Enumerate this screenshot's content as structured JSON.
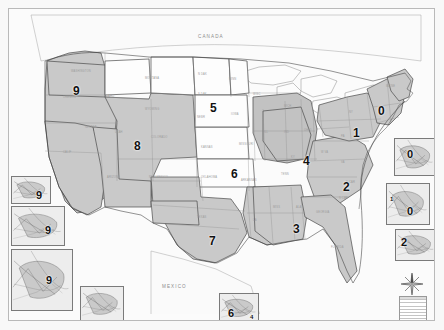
{
  "map": {
    "title": "United States Federal Judicial Circuits",
    "country_labels": [
      {
        "name": "canada",
        "text": "CANADA",
        "x": 197,
        "y": 33
      },
      {
        "name": "mexico",
        "text": "MEXICO",
        "x": 161,
        "y": 283
      }
    ],
    "circuits": [
      {
        "id": "circuit-9-pacific-northwest",
        "label": "9",
        "x": 72,
        "y": 84,
        "region": "Pacific Northwest"
      },
      {
        "id": "circuit-5-northern-plains",
        "label": "5",
        "x": 209,
        "y": 101,
        "region": "Northern Plains"
      },
      {
        "id": "circuit-0-new-england",
        "label": "0",
        "x": 377,
        "y": 104,
        "region": "New England"
      },
      {
        "id": "circuit-1-mid-atlantic-north",
        "label": "1",
        "x": 352,
        "y": 126,
        "region": "New York / Pennsylvania"
      },
      {
        "id": "circuit-8-mountain-west",
        "label": "8",
        "x": 133,
        "y": 139,
        "region": "Mountain West"
      },
      {
        "id": "circuit-6-central-plains",
        "label": "6",
        "x": 230,
        "y": 167,
        "region": "Central Plains"
      },
      {
        "id": "circuit-4-great-lakes",
        "label": "4",
        "x": 302,
        "y": 154,
        "region": "Great Lakes / Ohio Valley"
      },
      {
        "id": "circuit-2-southeast-atlantic",
        "label": "2",
        "x": 342,
        "y": 180,
        "region": "Virginia / Carolinas"
      },
      {
        "id": "circuit-3-deep-south",
        "label": "3",
        "x": 292,
        "y": 222,
        "region": "Deep South"
      },
      {
        "id": "circuit-7-south-central",
        "label": "7",
        "x": 208,
        "y": 234,
        "region": "Texas / South Central"
      }
    ],
    "state_labels": [
      {
        "text": "WASHINGTON",
        "x": 70,
        "y": 69
      },
      {
        "text": "OREGON",
        "x": 62,
        "y": 95
      },
      {
        "text": "IDAHO",
        "x": 104,
        "y": 94
      },
      {
        "text": "MONTANA",
        "x": 144,
        "y": 76
      },
      {
        "text": "WYOMING",
        "x": 144,
        "y": 107
      },
      {
        "text": "N DAK",
        "x": 197,
        "y": 72
      },
      {
        "text": "S DAK",
        "x": 197,
        "y": 92
      },
      {
        "text": "MINN",
        "x": 228,
        "y": 77
      },
      {
        "text": "WISC",
        "x": 252,
        "y": 92
      },
      {
        "text": "NEBR",
        "x": 196,
        "y": 115
      },
      {
        "text": "IOWA",
        "x": 230,
        "y": 112
      },
      {
        "text": "NEVADA",
        "x": 84,
        "y": 125
      },
      {
        "text": "UTAH",
        "x": 114,
        "y": 130
      },
      {
        "text": "COLORADO",
        "x": 150,
        "y": 135
      },
      {
        "text": "KANSAS",
        "x": 200,
        "y": 145
      },
      {
        "text": "MISSOURI",
        "x": 238,
        "y": 142
      },
      {
        "text": "ILL",
        "x": 263,
        "y": 130
      },
      {
        "text": "IND",
        "x": 283,
        "y": 130
      },
      {
        "text": "OHIO",
        "x": 303,
        "y": 128
      },
      {
        "text": "CALIF",
        "x": 62,
        "y": 150
      },
      {
        "text": "ARIZONA",
        "x": 106,
        "y": 175
      },
      {
        "text": "NEW MEXICO",
        "x": 148,
        "y": 175
      },
      {
        "text": "OKLAHOMA",
        "x": 200,
        "y": 175
      },
      {
        "text": "ARKANSAS",
        "x": 240,
        "y": 178
      },
      {
        "text": "TENN",
        "x": 280,
        "y": 172
      },
      {
        "text": "KY",
        "x": 290,
        "y": 155
      },
      {
        "text": "W VA",
        "x": 320,
        "y": 150
      },
      {
        "text": "VA",
        "x": 340,
        "y": 160
      },
      {
        "text": "N CAR",
        "x": 345,
        "y": 180
      },
      {
        "text": "S CAR",
        "x": 338,
        "y": 196
      },
      {
        "text": "GEORGIA",
        "x": 315,
        "y": 210
      },
      {
        "text": "ALA",
        "x": 295,
        "y": 205
      },
      {
        "text": "MISS",
        "x": 272,
        "y": 205
      },
      {
        "text": "LA",
        "x": 252,
        "y": 218
      },
      {
        "text": "TEXAS",
        "x": 196,
        "y": 215
      },
      {
        "text": "FLORIDA",
        "x": 330,
        "y": 245
      },
      {
        "text": "MICH",
        "x": 283,
        "y": 104
      },
      {
        "text": "NY",
        "x": 348,
        "y": 110
      },
      {
        "text": "PA",
        "x": 340,
        "y": 134
      },
      {
        "text": "MAINE",
        "x": 385,
        "y": 84
      }
    ],
    "insets": [
      {
        "name": "inset-puget-sound",
        "label": "9",
        "x": 10,
        "y": 175,
        "w": 40,
        "h": 28,
        "numx": 24,
        "numy": 13,
        "caption": "Puget Sound"
      },
      {
        "name": "inset-san-francisco-bay",
        "label": "9",
        "x": 10,
        "y": 205,
        "w": 54,
        "h": 40,
        "numx": 33,
        "numy": 18,
        "caption": "San Francisco Bay"
      },
      {
        "name": "inset-alaska",
        "label": "9",
        "x": 10,
        "y": 248,
        "w": 62,
        "h": 62,
        "numx": 34,
        "numy": 25,
        "caption": "Alaska"
      },
      {
        "name": "inset-hawaii",
        "label": "",
        "x": 79,
        "y": 285,
        "w": 44,
        "h": 36,
        "numx": 0,
        "numy": 0,
        "caption": "Hawaii"
      },
      {
        "name": "inset-gulf-south",
        "label": "6",
        "x": 218,
        "y": 292,
        "w": 40,
        "h": 30,
        "numx": 8,
        "numy": 14,
        "caption": "Gulf South"
      },
      {
        "name": "inset-boston",
        "label": "0",
        "x": 393,
        "y": 137,
        "w": 42,
        "h": 38,
        "numx": 12,
        "numy": 10,
        "caption": "Boston"
      },
      {
        "name": "inset-new-york",
        "label": "0",
        "x": 385,
        "y": 182,
        "w": 44,
        "h": 42,
        "numx": 20,
        "numy": 22,
        "caption": "New York"
      },
      {
        "name": "inset-chesapeake",
        "label": "2",
        "x": 394,
        "y": 228,
        "w": 42,
        "h": 32,
        "numx": 5,
        "numy": 7,
        "caption": "Chesapeake"
      }
    ],
    "inset_secondary_labels": [
      {
        "name": "inset-gulf-south-sub",
        "label": "4",
        "parent": "inset-gulf-south",
        "x": 30,
        "y": 20
      },
      {
        "name": "inset-new-york-sub",
        "label": "1",
        "parent": "inset-new-york",
        "x": 3,
        "y": 12
      }
    ],
    "compass": {
      "name": "compass-rose",
      "x": 400,
      "y": 272,
      "size": 22
    },
    "scale_bar": {
      "name": "scale-legend",
      "x": 398,
      "y": 295,
      "w": 26,
      "h": 26,
      "rows": 7
    }
  },
  "colors": {
    "shaded_region": "#c9c9c9",
    "light_region": "#fdfdfd",
    "border": "#4a4a4a",
    "state_line": "#8d8d8d",
    "frame": "#b9b9b9",
    "background": "#f8f8f8",
    "label_text": "#9b9b9b",
    "number_text": "#111111"
  }
}
